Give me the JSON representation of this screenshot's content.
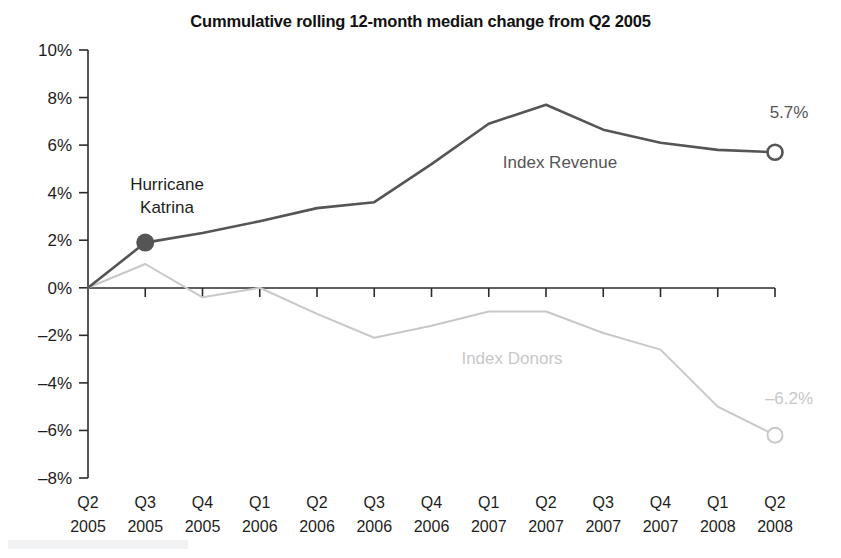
{
  "chart_data": {
    "type": "line",
    "title": "Cummulative rolling 12-month median change from Q2 2005",
    "xlabel": "",
    "ylabel": "",
    "grid": false,
    "legend_position": "inline-annotations",
    "categories": [
      "Q2 2005",
      "Q3 2005",
      "Q4 2005",
      "Q1 2006",
      "Q2 2006",
      "Q3 2006",
      "Q4 2006",
      "Q1 2007",
      "Q2 2007",
      "Q3 2007",
      "Q4 2007",
      "Q1 2008",
      "Q2 2008"
    ],
    "x_tick_labels_line1": [
      "Q2",
      "Q3",
      "Q4",
      "Q1",
      "Q2",
      "Q3",
      "Q4",
      "Q1",
      "Q2",
      "Q3",
      "Q4",
      "Q1",
      "Q2"
    ],
    "x_tick_labels_line2": [
      "2005",
      "2005",
      "2005",
      "2006",
      "2006",
      "2006",
      "2006",
      "2007",
      "2007",
      "2007",
      "2007",
      "2008",
      "2008"
    ],
    "y_tick_labels": [
      "10%",
      "8%",
      "6%",
      "4%",
      "2%",
      "0%",
      "–2%",
      "–4%",
      "–6%",
      "–8%"
    ],
    "y_tick_values": [
      10,
      8,
      6,
      4,
      2,
      0,
      -2,
      -4,
      -6,
      -8
    ],
    "ylim": [
      -8,
      10
    ],
    "series": [
      {
        "name": "Index Revenue",
        "color": "#555555",
        "values": [
          0.0,
          1.9,
          2.3,
          2.8,
          3.35,
          3.6,
          5.2,
          6.9,
          7.7,
          6.65,
          6.1,
          5.8,
          5.7
        ],
        "end_label": "5.7%",
        "end_marker": "open-circle",
        "label_text": "Index Revenue"
      },
      {
        "name": "Index Donors",
        "color": "#c8c8c8",
        "values": [
          0.0,
          1.0,
          -0.4,
          0.0,
          -1.1,
          -2.1,
          -1.6,
          -1.0,
          -1.0,
          -1.9,
          -2.6,
          -5.0,
          -6.2
        ],
        "end_label": "–6.2%",
        "end_marker": "open-circle",
        "label_text": "Index Donors"
      }
    ],
    "annotations": [
      {
        "name": "hurricane-katrina",
        "line1": "Hurricane",
        "line2": "Katrina",
        "point_category": "Q3 2005",
        "point_value": 1.9,
        "marker": "filled-circle",
        "marker_color": "#555555"
      }
    ]
  },
  "watermark": {
    "visible": true,
    "text": ""
  }
}
